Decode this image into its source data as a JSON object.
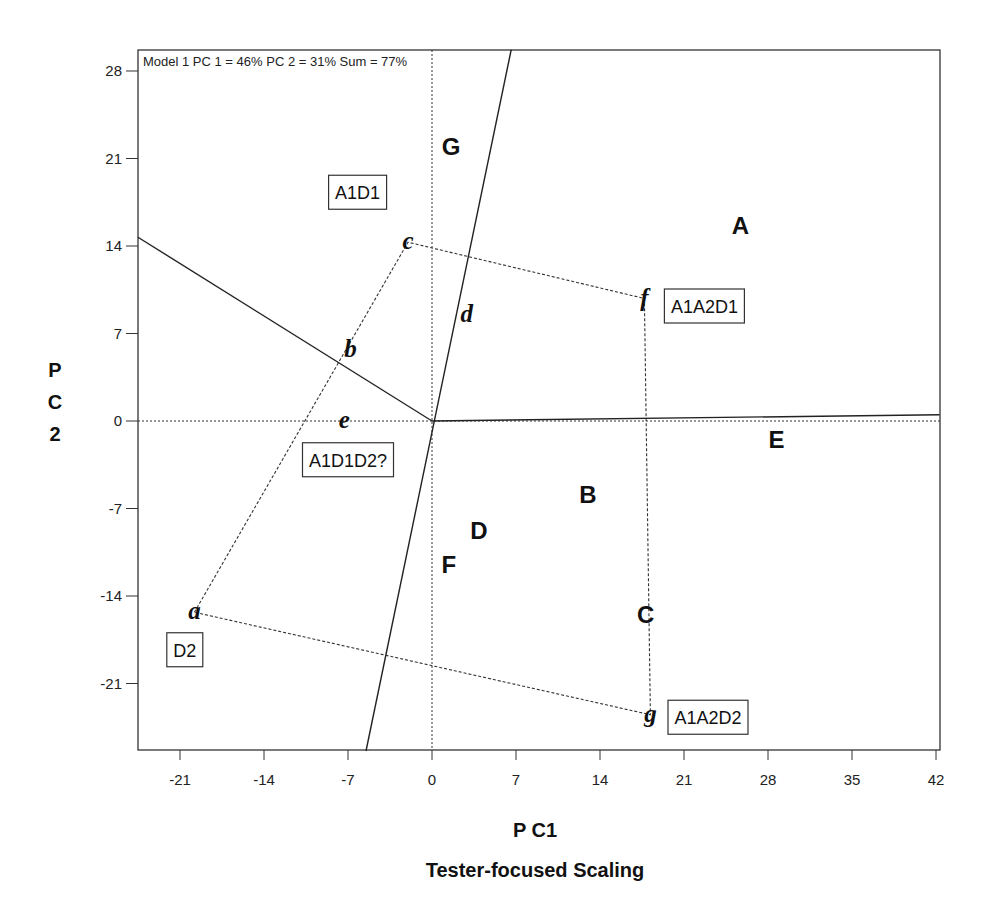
{
  "chart_data": {
    "type": "scatter",
    "title": "Tester-focused Scaling",
    "subtitle": "Model 1 PC 1 = 46% PC 2 = 31% Sum = 77%",
    "xlabel": "P C1",
    "ylabel": "P C 2",
    "xlim": [
      -24.5,
      42.3
    ],
    "ylim": [
      -26.4,
      29.7
    ],
    "xticks": [
      "-21",
      "-14",
      "-7",
      "0",
      "7",
      "14",
      "21",
      "28",
      "35",
      "42"
    ],
    "yticks": [
      "28",
      "21",
      "14",
      "7",
      "0",
      "-7",
      "-14",
      "-21"
    ],
    "grid": false,
    "objects": [
      {
        "label": "A",
        "x": 25.7,
        "y": 15.7
      },
      {
        "label": "B",
        "x": 13.0,
        "y": -5.8
      },
      {
        "label": "C",
        "x": 17.8,
        "y": -15.4
      },
      {
        "label": "D",
        "x": 3.9,
        "y": -8.7
      },
      {
        "label": "E",
        "x": 28.7,
        "y": -1.4
      },
      {
        "label": "F",
        "x": 1.4,
        "y": -11.4
      },
      {
        "label": "G",
        "x": 1.6,
        "y": 22.0
      }
    ],
    "attributes": [
      {
        "label": "a",
        "x": -19.8,
        "y": -15.3
      },
      {
        "label": "b",
        "x": -6.8,
        "y": 5.7
      },
      {
        "label": "c",
        "x": -2.0,
        "y": 14.3
      },
      {
        "label": "d",
        "x": 2.9,
        "y": 8.5
      },
      {
        "label": "e",
        "x": -7.3,
        "y": 0.0
      },
      {
        "label": "f",
        "x": 17.7,
        "y": 9.8
      },
      {
        "label": "g",
        "x": 18.2,
        "y": -23.5
      }
    ],
    "boxed_labels": [
      {
        "text": "A1D1",
        "x": -6.2,
        "y": 18.3
      },
      {
        "text": "A1A2D1",
        "x": 22.7,
        "y": 9.2
      },
      {
        "text": "A1D1D2?",
        "x": -7.0,
        "y": -3.1
      },
      {
        "text": "D2",
        "x": -20.6,
        "y": -18.3
      },
      {
        "text": "A1A2D2",
        "x": 23.0,
        "y": -23.7
      }
    ],
    "dotted_polygon": [
      "a",
      "c",
      "f",
      "g",
      "a"
    ],
    "solid_lines": [
      {
        "from": [
          0,
          0
        ],
        "to": [
          -24.5,
          14.7
        ]
      },
      {
        "from": [
          -5.5,
          -26.4
        ],
        "to": [
          6.6,
          29.7
        ]
      },
      {
        "from": [
          0,
          0
        ],
        "to": [
          42.3,
          0.5
        ]
      }
    ],
    "reference_lines": {
      "x0_dotted": true,
      "y0_dotted": true
    }
  }
}
